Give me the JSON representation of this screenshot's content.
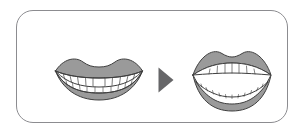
{
  "panel": {
    "name": "mouth-exercise-diagram",
    "border_color": "#8c8c90",
    "background_color": "#ffffff",
    "corner_radius_px": 17
  },
  "steps": [
    {
      "id": "step-1",
      "icon": "closed-mouth-smile-icon",
      "state": "closed",
      "description": "Closed smiling mouth showing upper and lower teeth touching",
      "lip_fill": "#9a9a9a",
      "teeth_fill": "#ffffff",
      "outline": "#3f3f3f",
      "upper_teeth_count": 10,
      "lower_teeth_count": 10
    },
    {
      "id": "step-2",
      "icon": "play-triangle-icon",
      "state": "arrow",
      "description": "Right pointing solid triangle arrow indicating progression",
      "fill": "#666668"
    },
    {
      "id": "step-3",
      "icon": "open-mouth-icon",
      "state": "open",
      "description": "Wide open mouth showing separated upper and lower teeth arcs",
      "lip_fill": "#9a9a9a",
      "teeth_fill": "#ffffff",
      "mouth_cavity_fill": "#ffffff",
      "outline": "#3f3f3f",
      "upper_teeth_count": 8,
      "lower_teeth_count": 12
    }
  ],
  "colors": {
    "lip_gray": "#9a9a9a",
    "outline_dark": "#3f3f3f",
    "arrow_gray": "#666668",
    "frame_gray": "#8c8c90",
    "white": "#ffffff"
  }
}
